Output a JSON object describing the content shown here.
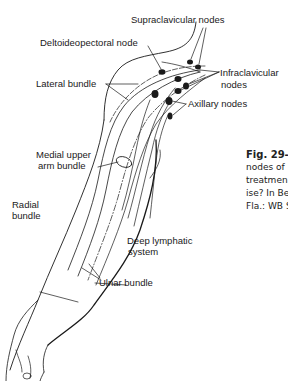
{
  "figure": {
    "labels": {
      "supraclavicular": "Supraclavicular nodes",
      "deltoideopectoral": "Deltoideopectoral node",
      "lateral_bundle": "Lateral bundle",
      "infraclavicular_1": "Infraclavicular",
      "infraclavicular_2": "nodes",
      "axillary": "Axillary nodes",
      "medial_upper_1": "Medial upper",
      "medial_upper_2": "arm bundle",
      "radial_1": "Radial",
      "radial_2": "bundle",
      "deep_lymphatic_1": "Deep lymphatic",
      "deep_lymphatic_2": "system",
      "ulnar_bundle": "Ulnar bundle"
    },
    "caption": {
      "fig_label": "Fig. 29-1",
      "lines": [
        "nodes of",
        "treatmen",
        "ise? In Be",
        "Fla.: WB S"
      ]
    },
    "colors": {
      "ink": "#1a1a1a",
      "background": "#ffffff"
    }
  }
}
